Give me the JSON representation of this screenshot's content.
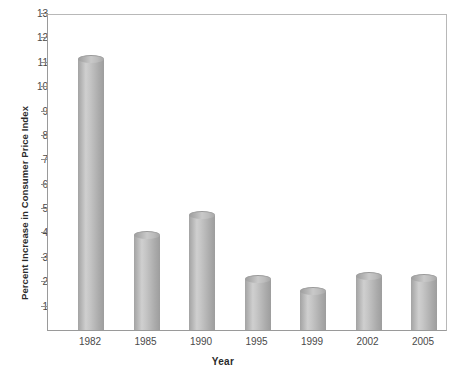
{
  "chart_data": {
    "type": "bar",
    "title": "",
    "subtitle": "",
    "xlabel": "Year",
    "ylabel": "Percent Increase in Consumer Price Index",
    "categories": [
      "1982",
      "1985",
      "1990",
      "1995",
      "1999",
      "2002",
      "2005"
    ],
    "values": [
      11.1,
      3.9,
      4.7,
      2.1,
      1.6,
      2.2,
      2.15
    ],
    "ylim": [
      0,
      13
    ],
    "ytick_labels": [
      "13",
      "12",
      "11",
      "10",
      "9",
      "8",
      "7",
      "6",
      "5",
      "4",
      "3",
      "2",
      "1"
    ],
    "ytick_values": [
      13,
      12,
      11,
      10,
      9,
      8,
      7,
      6,
      5,
      4,
      3,
      2,
      1
    ],
    "grid": false,
    "legend": null,
    "legend_position": "none",
    "bar_style": "3d-cylinder",
    "bar_color": "#c0c0c0",
    "axis_color": "#9a9a9a",
    "text_color": "#4a4a4a",
    "background": "#ffffff"
  }
}
